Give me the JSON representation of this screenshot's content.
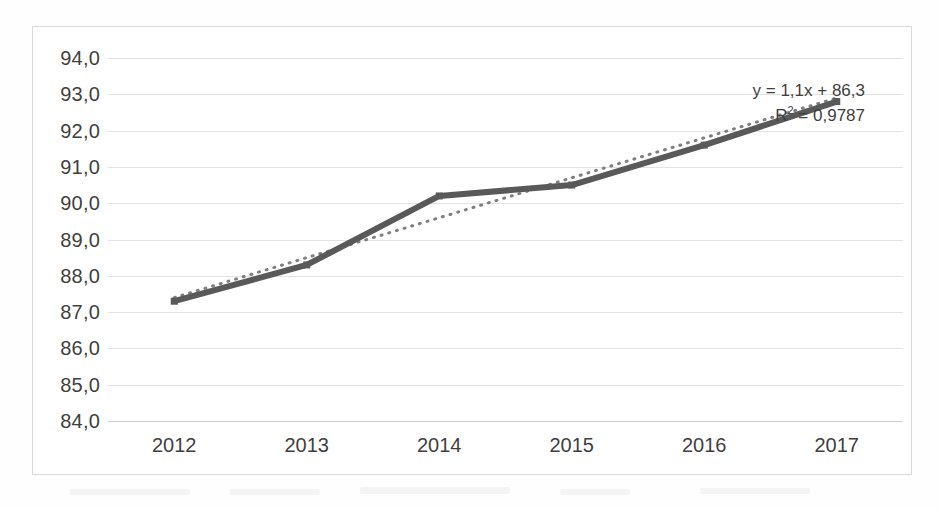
{
  "chart_data": {
    "type": "line",
    "title": "",
    "xlabel": "",
    "ylabel": "",
    "categories": [
      "2012",
      "2013",
      "2014",
      "2015",
      "2016",
      "2017"
    ],
    "series": [
      {
        "name": "series-1",
        "values": [
          87.3,
          88.3,
          90.2,
          90.5,
          91.6,
          92.8
        ],
        "style": "solid-line-with-square-markers",
        "color": "#595959"
      },
      {
        "name": "linear-trendline",
        "values": [
          87.4,
          88.5,
          89.6,
          90.7,
          91.8,
          92.9
        ],
        "style": "dotted-line",
        "color": "#7f7f7f"
      }
    ],
    "ylim": [
      84.0,
      94.0
    ],
    "ytick_labels": [
      "94,0",
      "93,0",
      "92,0",
      "91,0",
      "90,0",
      "89,0",
      "88,0",
      "87,0",
      "86,0",
      "85,0",
      "84,0"
    ],
    "ytick_values": [
      94.0,
      93.0,
      92.0,
      91.0,
      90.0,
      89.0,
      88.0,
      87.0,
      86.0,
      85.0,
      84.0
    ],
    "xtick_labels": [
      "2012",
      "2013",
      "2014",
      "2015",
      "2016",
      "2017"
    ],
    "grid": "horizontal",
    "legend": "none",
    "decimal_separator": ",",
    "annotations": {
      "equation": "y = 1,1x + 86,3",
      "r_squared_prefix": "R",
      "r_squared_exponent": "2",
      "r_squared_value": "= 0,9787"
    }
  },
  "colors": {
    "series_line": "#595959",
    "trendline": "#7f7f7f",
    "gridline": "#e2e2e2",
    "axis_text": "#3f3f3f",
    "chart_border": "#d9d9d9",
    "background": "#ffffff"
  }
}
